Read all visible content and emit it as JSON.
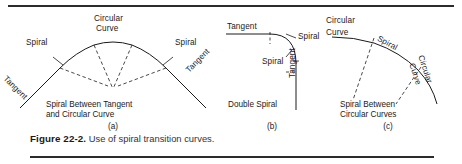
{
  "figure": {
    "number_label": "Figure 22-2.",
    "caption_text": "Use of spiral transition curves.",
    "stroke_color": "#1a1a1a",
    "rule_color": "#2b2b2b"
  },
  "panels": [
    {
      "id": "a",
      "letter": "(a)",
      "caption_line1": "Spiral Between Tangent",
      "caption_line2": "and Circular Curve",
      "labels": {
        "top_line1": "Circular",
        "top_line2": "Curve",
        "spiral_left": "Spiral",
        "spiral_right": "Spiral",
        "tangent_left": "Tangent",
        "tangent_right": "Tangent"
      }
    },
    {
      "id": "b",
      "letter": "(b)",
      "caption_line1": "Double Spiral",
      "caption_line2": "",
      "labels": {
        "tangent_horizontal": "Tangent",
        "spiral_upper": "Spiral",
        "spiral_lower": "Spiral",
        "tangent_vertical": "Tangent"
      }
    },
    {
      "id": "c",
      "letter": "(c)",
      "caption_line1": "Spiral Between",
      "caption_line2": "Circular Curves",
      "labels": {
        "circular_left_line1": "Circular",
        "circular_left_line2": "Curve",
        "spiral": "Spiral",
        "circular_right_line1": "Circular",
        "circular_right_line2": "Curve"
      }
    }
  ]
}
